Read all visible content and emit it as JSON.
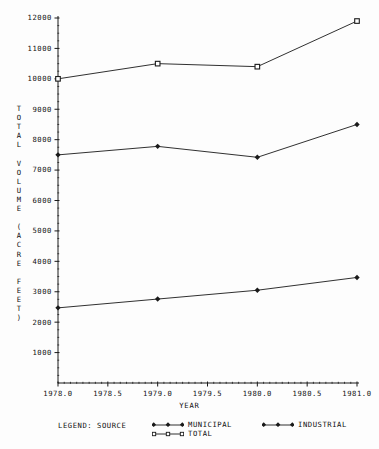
{
  "chart_data": {
    "type": "line",
    "title": "",
    "xlabel": "YEAR",
    "ylabel": "TOTAL VOLUME (ACRE FEET)",
    "ylabel_chars": [
      "T",
      "O",
      "T",
      "A",
      "L",
      " ",
      "V",
      "O",
      "L",
      "U",
      "M",
      "E",
      " ",
      "(",
      "A",
      "C",
      "R",
      "E",
      " ",
      "F",
      "E",
      "E",
      "T",
      ")"
    ],
    "x": [
      1978.0,
      1979.0,
      1980.0,
      1981.0
    ],
    "xlim": [
      1978.0,
      1981.0
    ],
    "ylim": [
      0,
      12000
    ],
    "xticks": [
      1978.0,
      1978.5,
      1979.0,
      1979.5,
      1980.0,
      1980.5,
      1981.0
    ],
    "xtick_labels": [
      "1978.0",
      "1978.5",
      "1979.0",
      "1979.5",
      "1980.0",
      "1980.5",
      "1981.0"
    ],
    "yticks": [
      1000,
      2000,
      3000,
      4000,
      5000,
      6000,
      7000,
      8000,
      9000,
      10000,
      11000,
      12000
    ],
    "ytick_labels": [
      "1000",
      "2000",
      "3000",
      "4000",
      "5000",
      "6000",
      "7000",
      "8000",
      "9000",
      "10000",
      "11000",
      "12000"
    ],
    "grid": false,
    "minor_ticks": true,
    "legend_position": "bottom",
    "series": [
      {
        "name": "MUNICIPAL",
        "marker": "filled-diamond",
        "color": "#1a1a1a",
        "values": [
          7500,
          7780,
          7420,
          8500
        ]
      },
      {
        "name": "TOTAL",
        "marker": "open-square",
        "color": "#1a1a1a",
        "values": [
          10000,
          10500,
          10400,
          11900
        ]
      },
      {
        "name": "INDUSTRIAL",
        "marker": "filled-diamond",
        "color": "#1a1a1a",
        "values": [
          2470,
          2760,
          3050,
          3470
        ]
      }
    ]
  },
  "legend": {
    "title": "LEGEND: SOURCE",
    "entries": [
      {
        "label": "MUNICIPAL",
        "marker": "filled-diamond"
      },
      {
        "label": "TOTAL",
        "marker": "open-square"
      },
      {
        "label": "INDUSTRIAL",
        "marker": "filled-diamond"
      }
    ]
  },
  "axes": {
    "x_title": "YEAR",
    "y_title": "TOTAL VOLUME (ACRE FEET)"
  }
}
